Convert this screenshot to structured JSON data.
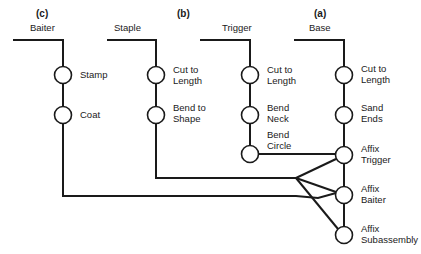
{
  "diagram": {
    "type": "assembly-process-chart",
    "components": [
      {
        "id": "c",
        "tag": "(c)",
        "name": "Baiter",
        "operations": [
          "Stamp",
          "Coat"
        ]
      },
      {
        "id": "b",
        "tag": "(b)",
        "name": "Staple",
        "operations": [
          "Cut to Length",
          "Bend to Shape"
        ]
      },
      {
        "id": "t",
        "tag": "",
        "name": "Trigger",
        "operations": [
          "Cut to Length",
          "Bend Neck",
          "Bend Circle"
        ]
      },
      {
        "id": "a",
        "tag": "(a)",
        "name": "Base",
        "operations": [
          "Cut to Length",
          "Sand Ends",
          "Affix Trigger",
          "Affix Baiter",
          "Affix Subassembly"
        ]
      }
    ],
    "labels": {
      "c_tag": "(c)",
      "b_tag": "(b)",
      "a_tag": "(a)",
      "baiter": "Baiter",
      "staple": "Staple",
      "trigger": "Trigger",
      "base": "Base",
      "baiter_op1": "Stamp",
      "baiter_op2": "Coat",
      "staple_op1_l1": "Cut to",
      "staple_op1_l2": "Length",
      "staple_op2_l1": "Bend to",
      "staple_op2_l2": "Shape",
      "trigger_op1_l1": "Cut to",
      "trigger_op1_l2": "Length",
      "trigger_op2_l1": "Bend",
      "trigger_op2_l2": "Neck",
      "trigger_op3_l1": "Bend",
      "trigger_op3_l2": "Circle",
      "base_op1_l1": "Cut to",
      "base_op1_l2": "Length",
      "base_op2_l1": "Sand",
      "base_op2_l2": "Ends",
      "base_op3_l1": "Affix",
      "base_op3_l2": "Trigger",
      "base_op4_l1": "Affix",
      "base_op4_l2": "Baiter",
      "base_op5_l1": "Affix",
      "base_op5_l2": "Subassembly"
    },
    "colors": {
      "ink": "#1a1a1a",
      "background": "#ffffff"
    }
  }
}
